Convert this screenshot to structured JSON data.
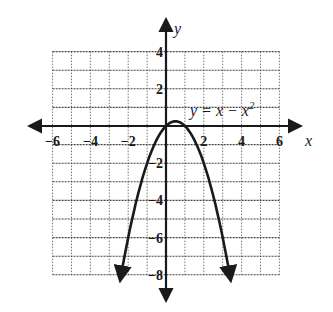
{
  "chart_data": {
    "type": "line",
    "title": "",
    "equation_label": "y = x − x²",
    "equation_parts": {
      "base": "y = x − x",
      "exp": "2"
    },
    "xlabel": "x",
    "ylabel": "y",
    "xlim": [
      -6,
      6
    ],
    "ylim": [
      -8,
      4
    ],
    "grid": true,
    "grid_step": 1,
    "x_ticks": [
      -6,
      -4,
      -2,
      2,
      4,
      6
    ],
    "x_tick_labels": [
      "−6",
      "−4",
      "−2",
      "2",
      "4",
      "6"
    ],
    "y_ticks": [
      4,
      2,
      -2,
      -4,
      -6,
      -8
    ],
    "y_tick_labels": [
      "4",
      "2",
      "−2",
      "−4",
      "−6",
      "−8"
    ],
    "series": [
      {
        "name": "y = x - x^2",
        "function": "x - x^2",
        "x": [
          -2.4,
          -2,
          -1.5,
          -1,
          -0.5,
          0,
          0.5,
          1,
          1.5,
          2,
          2.5,
          3,
          3.3
        ],
        "y": [
          -8.16,
          -6,
          -3.75,
          -2,
          -0.75,
          0,
          0.25,
          0,
          -0.75,
          -2,
          -3.75,
          -6,
          -7.59
        ],
        "arrows_both_ends": true
      }
    ],
    "vertex": {
      "x": 0.5,
      "y": 0.25
    }
  }
}
